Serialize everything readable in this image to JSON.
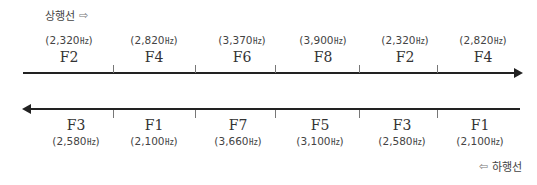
{
  "upbound": {
    "label": "상행선",
    "arrow_icon": "⇨",
    "cells": [
      {
        "name": "F2",
        "freq": "2,320",
        "unit": "㎐"
      },
      {
        "name": "F4",
        "freq": "2,820",
        "unit": "㎐"
      },
      {
        "name": "F6",
        "freq": "3,370",
        "unit": "㎐"
      },
      {
        "name": "F8",
        "freq": "3,900",
        "unit": "㎐"
      },
      {
        "name": "F2",
        "freq": "2,320",
        "unit": "㎐"
      },
      {
        "name": "F4",
        "freq": "2,820",
        "unit": "㎐"
      }
    ]
  },
  "downbound": {
    "label": "하행선",
    "arrow_icon": "⇦",
    "cells": [
      {
        "name": "F3",
        "freq": "2,580",
        "unit": "㎐"
      },
      {
        "name": "F1",
        "freq": "2,100",
        "unit": "㎐"
      },
      {
        "name": "F7",
        "freq": "3,660",
        "unit": "㎐"
      },
      {
        "name": "F5",
        "freq": "3,100",
        "unit": "㎐"
      },
      {
        "name": "F3",
        "freq": "2,580",
        "unit": "㎐"
      },
      {
        "name": "F1",
        "freq": "2,100",
        "unit": "㎐"
      }
    ]
  },
  "colors": {
    "line": "#222222",
    "text": "#333333",
    "tick": "#777777"
  }
}
